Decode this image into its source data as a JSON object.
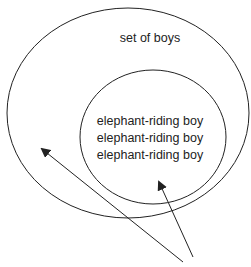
{
  "diagram": {
    "outer_set": {
      "label": "set of boys"
    },
    "inner_set": {
      "members": [
        "elephant-riding boy",
        "elephant-riding boy",
        "elephant-riding boy"
      ]
    },
    "arrows": [
      {
        "name": "arrow-to-outer-set"
      },
      {
        "name": "arrow-to-inner-set"
      }
    ],
    "colors": {
      "stroke": "#222222",
      "background": "#ffffff"
    }
  }
}
